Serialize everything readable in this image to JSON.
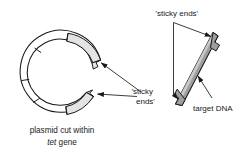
{
  "figure": {
    "background_color": "#ffffff",
    "stroke_color": "#1a1a1a",
    "segment_fill_light": "#e6e6e6",
    "segment_fill_white": "#ffffff",
    "dna_fill": "#9e9e9e",
    "dna_fill_light": "#cfcfcf"
  },
  "labels": {
    "sticky_ends_top": "'sticky ends'",
    "sticky_ends_mid_line1": "'sticky",
    "sticky_ends_mid_line2": "ends'",
    "target_dna": "target DNA",
    "caption_line1": "plasmid cut within",
    "caption_gene": "tet",
    "caption_line2_rest": " gene"
  },
  "elements": {
    "plasmid_name": "cut-plasmid-ring",
    "dna_name": "target-dna-fragment",
    "arrow_names": [
      "arrow-to-upper-sticky-end",
      "arrow-to-lower-sticky-end",
      "arrow-to-dna-sticky-end",
      "arrow-to-target-dna"
    ]
  }
}
